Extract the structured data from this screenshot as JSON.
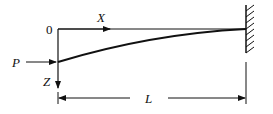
{
  "diagram": {
    "type": "cantilever-beam-deflection",
    "labels": {
      "origin": "0",
      "x_axis": "X",
      "z_axis": "Z",
      "load": "P",
      "length": "L"
    },
    "colors": {
      "ink": "#111111",
      "background": "#ffffff"
    }
  }
}
